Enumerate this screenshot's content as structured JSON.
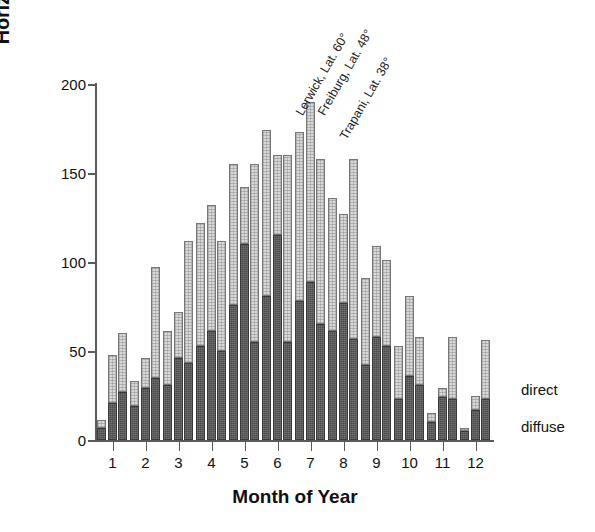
{
  "chart_data": {
    "type": "bar",
    "subtype": "grouped-stacked",
    "title": "",
    "xlabel": "Month of Year",
    "ylabel": "Horizontal Irradiation Sum [kWh/m2]",
    "ylim": [
      0,
      200
    ],
    "yticks": [
      0,
      50,
      100,
      150,
      200
    ],
    "ytick_labels": [
      "0",
      "50",
      "100",
      "150",
      "200"
    ],
    "grid": false,
    "categories": [
      "1",
      "2",
      "3",
      "4",
      "5",
      "6",
      "7",
      "8",
      "9",
      "10",
      "11",
      "12"
    ],
    "xtick_labels": [
      "1",
      "2",
      "3",
      "4",
      "5",
      "6",
      "7",
      "8",
      "9",
      "10",
      "11",
      "12"
    ],
    "stack_order": [
      "diffuse",
      "direct"
    ],
    "stack_labels": {
      "diffuse": "diffuse",
      "direct": "direct"
    },
    "legend_position": "inside-right",
    "sites": [
      {
        "key": "lerwick",
        "label": "Lerwick, Lat. 60°"
      },
      {
        "key": "freiburg",
        "label": "Freiburg, Lat. 48°"
      },
      {
        "key": "trapani",
        "label": "Trapani, Lat. 38°"
      }
    ],
    "series": [
      {
        "name": "Lerwick, Lat. 60° diffuse",
        "site": "lerwick",
        "component": "diffuse",
        "values": [
          7,
          19,
          31,
          53,
          76,
          81,
          78,
          61,
          42,
          23,
          10,
          5
        ]
      },
      {
        "name": "Lerwick, Lat. 60° direct",
        "site": "lerwick",
        "component": "direct",
        "values": [
          4,
          14,
          30,
          69,
          79,
          93,
          95,
          75,
          49,
          30,
          5,
          2
        ]
      },
      {
        "name": "Lerwick, Lat. 60° total",
        "site": "lerwick",
        "component": "total",
        "values": [
          11,
          33,
          61,
          122,
          155,
          174,
          173,
          136,
          91,
          53,
          15,
          7
        ]
      },
      {
        "name": "Freiburg, Lat. 48° diffuse",
        "site": "freiburg",
        "component": "diffuse",
        "values": [
          21,
          29,
          46,
          61,
          110,
          115,
          89,
          77,
          58,
          36,
          24,
          17
        ]
      },
      {
        "name": "Freiburg, Lat. 48° direct",
        "site": "freiburg",
        "component": "direct",
        "values": [
          27,
          17,
          26,
          71,
          32,
          45,
          101,
          50,
          51,
          45,
          5,
          8
        ]
      },
      {
        "name": "Freiburg, Lat. 48° total",
        "site": "freiburg",
        "component": "total",
        "values": [
          48,
          46,
          72,
          132,
          142,
          160,
          190,
          127,
          109,
          81,
          29,
          25
        ]
      },
      {
        "name": "Trapani, Lat. 38° diffuse",
        "site": "trapani",
        "component": "diffuse",
        "values": [
          27,
          35,
          43,
          50,
          55,
          55,
          65,
          57,
          53,
          31,
          23,
          23
        ]
      },
      {
        "name": "Trapani, Lat. 38° direct",
        "site": "trapani",
        "component": "direct",
        "values": [
          33,
          62,
          69,
          62,
          100,
          105,
          93,
          101,
          48,
          27,
          35,
          33
        ]
      },
      {
        "name": "Trapani, Lat. 38° total",
        "site": "trapani",
        "component": "total",
        "values": [
          60,
          97,
          112,
          112,
          155,
          160,
          158,
          158,
          101,
          58,
          58,
          56
        ]
      }
    ],
    "annotations": [
      {
        "text": "Lerwick, Lat. 60°",
        "rotation": -60
      },
      {
        "text": "Freiburg, Lat. 48°",
        "rotation": -60
      },
      {
        "text": "Trapani, Lat. 38°",
        "rotation": -60
      }
    ],
    "callouts": [
      {
        "text": "direct",
        "points_to": "direct-segment"
      },
      {
        "text": "diffuse",
        "points_to": "diffuse-segment"
      }
    ],
    "colors": {
      "diffuse": "#4a4a4a",
      "direct": "#d8d8d8",
      "axis": "#5a5a5a",
      "text": "#111111",
      "background": "#ffffff"
    }
  }
}
